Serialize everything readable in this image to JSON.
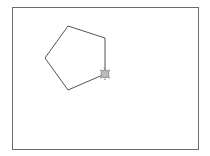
{
  "canvas": {
    "background": "#ffffff",
    "border_color": "#6b6b6b"
  },
  "drawing": {
    "shape": "pentagon",
    "stroke_color": "#555555",
    "vertices": [
      [
        68,
        26
      ],
      [
        105,
        38
      ],
      [
        105,
        74
      ],
      [
        68,
        90
      ],
      [
        45,
        58
      ]
    ]
  },
  "turtle": {
    "icon": "turtle-icon",
    "x": 105,
    "y": 74,
    "color": "#888888"
  }
}
